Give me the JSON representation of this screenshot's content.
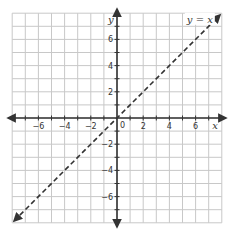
{
  "chart_data": {
    "type": "line",
    "title": "",
    "xlabel": "x",
    "ylabel": "y",
    "xlim": [
      -8,
      8
    ],
    "ylim": [
      -8,
      8
    ],
    "grid": true,
    "x_ticks": [
      -6,
      -4,
      -2,
      2,
      4,
      6
    ],
    "y_ticks": [
      6,
      4,
      2,
      -2,
      -4,
      -6
    ],
    "x_tick_labels": [
      "−6",
      "−4",
      "−2",
      "2",
      "4",
      "6"
    ],
    "y_tick_labels": [
      "6",
      "4",
      "2",
      "−2",
      "−4",
      "−6"
    ],
    "origin_label": "0",
    "series": [
      {
        "name": "y = x",
        "style": "dashed",
        "arrows": "both",
        "x": [
          -8,
          8
        ],
        "y": [
          -8,
          8
        ]
      }
    ],
    "annotations": [
      {
        "text": "y = x",
        "x": 6.4,
        "y": 7.5
      }
    ]
  },
  "colors": {
    "grid": "#c8c8c8",
    "axis": "#333333",
    "line": "#333333",
    "background": "#ffffff"
  }
}
